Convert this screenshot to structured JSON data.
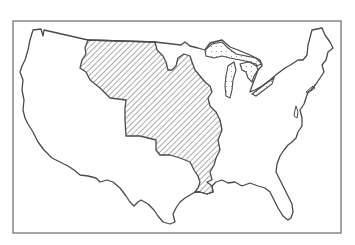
{
  "map": {
    "subject": "Contiguous United States outline with hatched central region (Louisiana Purchase territory)",
    "colors": {
      "background": "#ffffff",
      "outline": "#4a4a4a",
      "hatch": "#555555",
      "frame": "#6a6a6a",
      "lakes_stipple": "#777777"
    },
    "regions": [
      {
        "name": "louisiana-purchase",
        "style": "diagonal-hatch"
      },
      {
        "name": "great-lakes",
        "style": "stipple"
      }
    ]
  }
}
